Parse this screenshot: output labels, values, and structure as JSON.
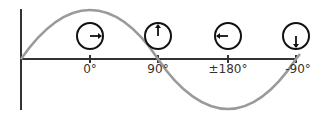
{
  "diagram": {
    "type": "phase-wave",
    "colors": {
      "axis": "#333333",
      "wave": "#9a9a9a",
      "circle": "#111111"
    },
    "phases": [
      {
        "label": "0°",
        "x": 90,
        "hand": "right"
      },
      {
        "label": "90°",
        "x": 158,
        "hand": "up"
      },
      {
        "label": "±180°",
        "x": 228,
        "hand": "left"
      },
      {
        "label": "-90°",
        "x": 296,
        "hand": "down"
      }
    ]
  }
}
